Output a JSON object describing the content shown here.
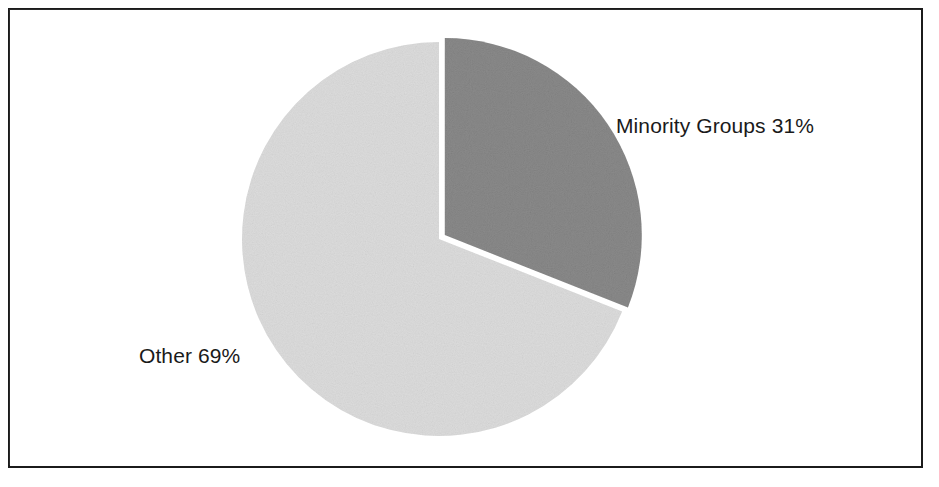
{
  "figure": {
    "background": "#ffffff",
    "frame_color": "#1b1b1b",
    "text_color": "#1a1a1a"
  },
  "chart_data": {
    "type": "pie",
    "title": "",
    "subtitle": "",
    "xlabel": "",
    "ylabel": "",
    "grid": false,
    "legend_position": "none",
    "labels_inline": true,
    "start_angle_deg": 0,
    "direction": "clockwise",
    "center": {
      "x": 439,
      "y": 239
    },
    "radius": 197,
    "categories": [
      "Minority Groups",
      "Other"
    ],
    "values": [
      31,
      69
    ],
    "value_unit": "%",
    "slices": [
      {
        "name": "Minority Groups",
        "value": 31,
        "value_text": "31%",
        "label": "Minority Groups 31%",
        "color": "#8a8a8a",
        "start_angle_deg": 0,
        "end_angle_deg": 111.6,
        "exploded": true,
        "explode_offset_px": 7
      },
      {
        "name": "Other",
        "value": 69,
        "value_text": "69%",
        "label": "Other 69%",
        "color": "#dcdcdc",
        "start_angle_deg": 111.6,
        "end_angle_deg": 360,
        "exploded": false,
        "explode_offset_px": 0
      }
    ],
    "annotations": [
      {
        "text": "Minority Groups 31%",
        "x": 616,
        "y": 115
      },
      {
        "text": "Other 69%",
        "x": 139,
        "y": 345
      }
    ]
  },
  "labels": {
    "minority": "Minority Groups 31%",
    "other": "Other 69%"
  }
}
